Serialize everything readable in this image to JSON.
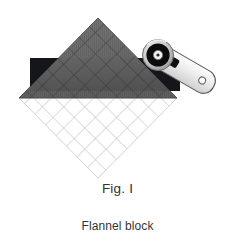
{
  "figure": {
    "fig_label": "Fig. I",
    "title": "Flannel block",
    "background_color": "#ffffff",
    "text_color": "#333333"
  },
  "illustration": {
    "name": "flannel-quilt-block-with-rotary-cutter",
    "block": {
      "name": "flannel-block-diamond",
      "shape": "diamond",
      "apex_top": {
        "x": 98,
        "y": 18
      },
      "vertex_left": {
        "x": 19,
        "y": 98
      },
      "vertex_right": {
        "x": 177,
        "y": 98
      },
      "vertex_bottom": {
        "x": 98,
        "y": 178
      },
      "upper_half_fill": "#6e6e6e",
      "lower_half_fill": "#ffffff",
      "upper_grid_line_color": "#3f3f3f",
      "lower_grid_line_color": "#b9b9b9",
      "grid_spacing_px": 15,
      "grid_orientation": "diagonal-crosshatch"
    },
    "ruler_bar": {
      "name": "dark-fabric-strip",
      "x": 30,
      "y": 58,
      "width": 150,
      "height": 33,
      "fill": "#15161a"
    },
    "rotary_cutter": {
      "name": "rotary-cutter-tool",
      "blade_center": {
        "x": 158,
        "y": 55
      },
      "blade_outer_radius": 15,
      "blade_inner_radius": 8,
      "blade_color": "#0d0d0d",
      "blade_ring_color": "#c9c9c9",
      "handle_color": "#e9e9e9",
      "handle_outline": "#4a4a4a",
      "handle_angle_deg": 32,
      "handle_hole": {
        "x": 204,
        "y": 79,
        "r": 3
      }
    }
  }
}
